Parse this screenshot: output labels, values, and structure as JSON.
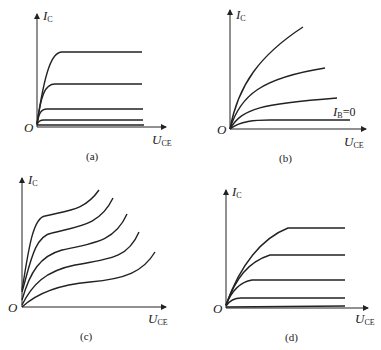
{
  "figure": {
    "panels": [
      {
        "id": "a",
        "caption": "(a)",
        "y_label": "I",
        "y_sub": "C",
        "x_label": "U",
        "x_sub": "CE",
        "origin": "O"
      },
      {
        "id": "b",
        "caption": "(b)",
        "y_label": "I",
        "y_sub": "C",
        "x_label": "U",
        "x_sub": "CE",
        "origin": "O",
        "annotation": "I",
        "annotation_sub": "B",
        "annotation_val": "=0"
      },
      {
        "id": "c",
        "caption": "(c)",
        "y_label": "I",
        "y_sub": "C",
        "x_label": "U",
        "x_sub": "CE",
        "origin": "O"
      },
      {
        "id": "d",
        "caption": "(d)",
        "y_label": "I",
        "y_sub": "C",
        "x_label": "U",
        "x_sub": "CE",
        "origin": "O"
      }
    ]
  }
}
